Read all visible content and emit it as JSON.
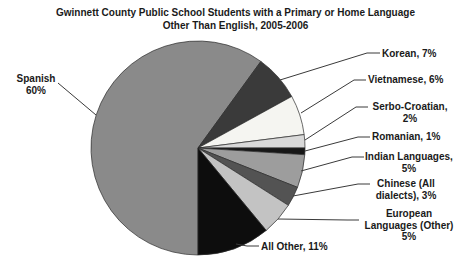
{
  "chart_data": {
    "type": "pie",
    "title": "Gwinnett County Public School Students with a Primary or Home Language Other Than English, 2005-2006",
    "title_lines": [
      "Gwinnett County Public School Students with a Primary or Home Language",
      "Other Than English, 2005-2006"
    ],
    "units": "%",
    "start_angle_deg": 180,
    "direction": "clockwise",
    "legend": "none",
    "slices": [
      {
        "name": "Spanish",
        "value": 60,
        "color": "#8a8a8a",
        "label_lines": [
          "Spanish",
          "60%"
        ]
      },
      {
        "name": "Korean",
        "value": 7,
        "color": "#3a3a3a",
        "label_lines": [
          "Korean, 7%"
        ]
      },
      {
        "name": "Vietnamese",
        "value": 6,
        "color": "#f5f5f1",
        "label_lines": [
          "Vietnamese, 6%"
        ]
      },
      {
        "name": "Serbo-Croatian",
        "value": 2,
        "color": "#d9d9d9",
        "label_lines": [
          "Serbo-Croatian,",
          "2%"
        ]
      },
      {
        "name": "Romanian",
        "value": 1,
        "color": "#171717",
        "label_lines": [
          "Romanian, 1%"
        ]
      },
      {
        "name": "Indian Languages",
        "value": 5,
        "color": "#9d9d9d",
        "label_lines": [
          "Indian Languages,",
          "5%"
        ]
      },
      {
        "name": "Chinese (All dialects)",
        "value": 3,
        "color": "#535353",
        "label_lines": [
          "Chinese (All",
          "dialects), 3%"
        ]
      },
      {
        "name": "European Languages (Other)",
        "value": 5,
        "color": "#c3c3c3",
        "label_lines": [
          "European",
          "Languages (Other)",
          "5%"
        ]
      },
      {
        "name": "All Other",
        "value": 11,
        "color": "#0d0d0d",
        "label_lines": [
          "All Other, 11%"
        ]
      }
    ],
    "colors": {
      "background": "#ffffff",
      "text": "#1a1a1a",
      "leader_line": "#3a3a3a",
      "slice_border": "#2b2b2b"
    }
  }
}
